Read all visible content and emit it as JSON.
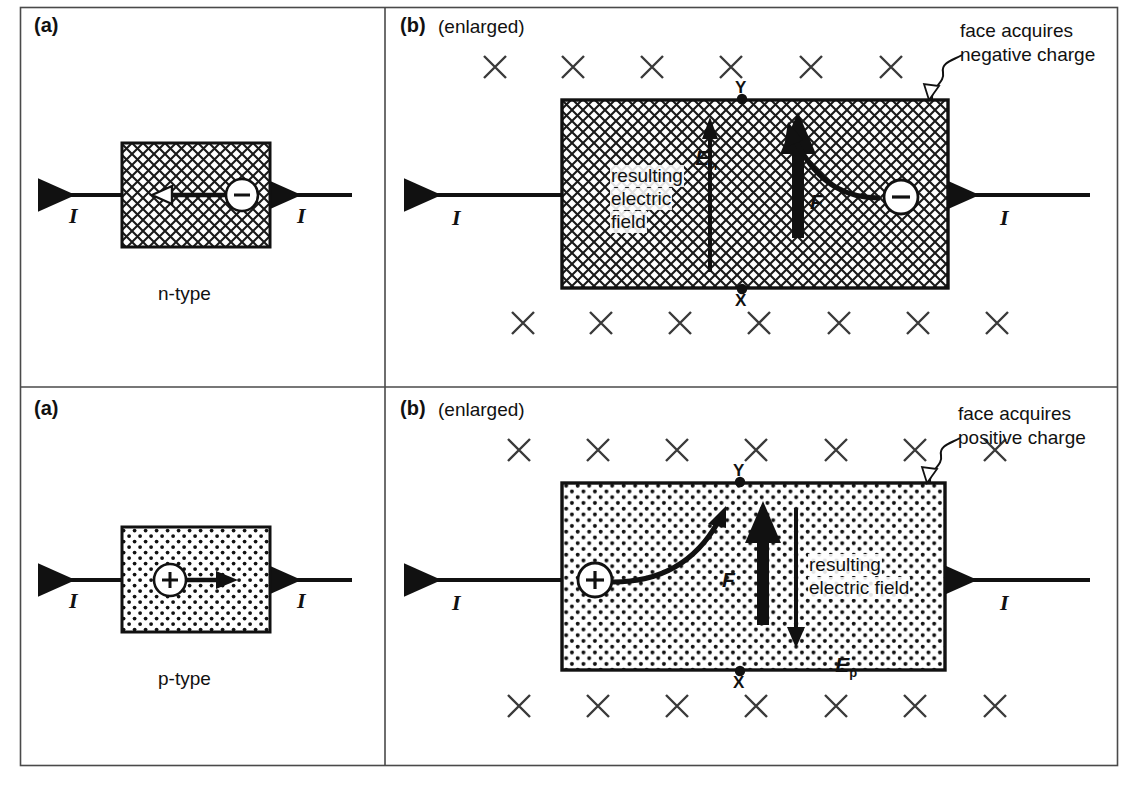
{
  "figure": {
    "title_domain": "hall-effect-diagram",
    "background": "#ffffff",
    "ink": "#111111"
  },
  "panels": {
    "top_left": {
      "tag": "(a)",
      "material_label": "n-type",
      "current_in_label": "I",
      "current_out_label": "I",
      "carrier_sign": "−",
      "carrier_drift_direction": "left",
      "fill": "cross-hatch"
    },
    "top_right": {
      "tag": "(b)",
      "subtitle": "(enlarged)",
      "current_in_label": "I",
      "current_out_label": "I",
      "carrier_sign": "−",
      "field_symbol": "E",
      "field_subscript": "n",
      "field_note_line1": "resulting",
      "field_note_line2": "electric",
      "field_note_line3": "field",
      "force_symbol": "F",
      "corner_top_label": "Y",
      "corner_bottom_label": "X",
      "callout_line1": "face acquires",
      "callout_line2": "negative charge",
      "fill": "cross-hatch",
      "magnetic_field_glyph": "✕",
      "field_rows": {
        "top_count": 6,
        "bottom_count": 7
      }
    },
    "bottom_left": {
      "tag": "(a)",
      "material_label": "p-type",
      "current_in_label": "I",
      "current_out_label": "I",
      "carrier_sign": "+",
      "carrier_drift_direction": "right",
      "fill": "dot-stipple"
    },
    "bottom_right": {
      "tag": "(b)",
      "subtitle": "(enlarged)",
      "current_in_label": "I",
      "current_out_label": "I",
      "carrier_sign": "+",
      "field_symbol": "E",
      "field_subscript": "p",
      "field_note_line1": "resulting",
      "field_note_line2": "electric field",
      "force_symbol": "F",
      "corner_top_label": "Y",
      "corner_bottom_label": "X",
      "callout_line1": "face acquires",
      "callout_line2": "positive charge",
      "fill": "dot-stipple",
      "magnetic_field_glyph": "✕",
      "field_rows": {
        "top_count": 6,
        "bottom_count": 6
      }
    }
  }
}
